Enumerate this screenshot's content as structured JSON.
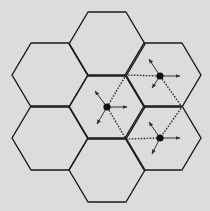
{
  "diagram": {
    "title": "",
    "background": "#dcdcdc",
    "stroke_color": "#1a1a1a",
    "hex_side": 38,
    "hex_half_height": 32,
    "cells": [
      {
        "id": "top",
        "cx": 107,
        "cy": 44
      },
      {
        "id": "upper-left",
        "cx": 50,
        "cy": 75
      },
      {
        "id": "upper-right",
        "cx": 163,
        "cy": 75
      },
      {
        "id": "center",
        "cx": 107,
        "cy": 107
      },
      {
        "id": "lower-left",
        "cx": 50,
        "cy": 138
      },
      {
        "id": "lower-right",
        "cx": 163,
        "cy": 138
      },
      {
        "id": "bottom",
        "cx": 107,
        "cy": 170
      }
    ],
    "nodes": [
      {
        "id": "node-center",
        "x": 107,
        "y": 107,
        "arrows": [
          [
            127,
            107
          ],
          [
            95,
            91
          ],
          [
            97,
            124
          ]
        ]
      },
      {
        "id": "node-upper-right",
        "x": 160,
        "y": 76,
        "arrows": [
          [
            180,
            76
          ],
          [
            149,
            59
          ],
          [
            152,
            88
          ]
        ]
      },
      {
        "id": "node-lower-right",
        "x": 160,
        "y": 138,
        "arrows": [
          [
            180,
            138
          ],
          [
            149,
            122
          ],
          [
            152,
            154
          ]
        ]
      }
    ],
    "dotted_path": [
      [
        107,
        107
      ],
      [
        126,
        75
      ],
      [
        160,
        76
      ],
      [
        182,
        107
      ],
      [
        160,
        138
      ],
      [
        126,
        139
      ],
      [
        107,
        107
      ]
    ]
  }
}
